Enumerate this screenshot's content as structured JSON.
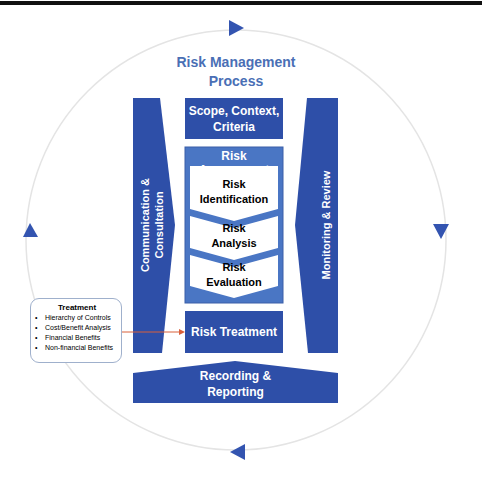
{
  "title": "Risk Management Process",
  "title_lines": [
    "Risk Management",
    "Process"
  ],
  "scope": {
    "lines": [
      "Scope, Context,",
      "Criteria"
    ]
  },
  "risk_assessment": {
    "label": "Risk Assessment",
    "steps": [
      {
        "lines": [
          "Risk",
          "Identification"
        ]
      },
      {
        "lines": [
          "Risk",
          "Analysis"
        ]
      },
      {
        "lines": [
          "Risk",
          "Evaluation"
        ]
      }
    ]
  },
  "risk_treatment": {
    "label": "Risk Treatment"
  },
  "recording": {
    "lines": [
      "Recording &",
      "Reporting"
    ]
  },
  "communication": {
    "lines": [
      "Communication &",
      "Consultation"
    ]
  },
  "monitoring": {
    "label": "Monitoring & Review"
  },
  "treatment_box": {
    "title": "Treatment",
    "items": [
      "Hierarchy of Controls",
      "Cost/Benefit Analysis",
      "Financial Benefits",
      "Non-financial Benefits"
    ]
  },
  "colors": {
    "primary": "#2e4fa8",
    "assessment_frame": "#4a76c4",
    "title_text": "#4a6fb5",
    "arrow_connector": "#d9603b",
    "cycle_circle": "#e6e6e6"
  }
}
